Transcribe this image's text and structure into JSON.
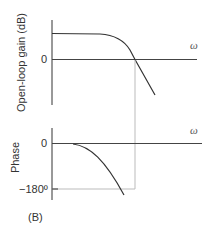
{
  "figure_label": "(B)",
  "gain_plot": {
    "ylabel": "Open-loop gain (dB)",
    "zero_tick": "0",
    "xlabel": "ω"
  },
  "phase_plot": {
    "ylabel": "Phase",
    "zero_tick": "0",
    "minus180_tick": "−180º",
    "xlabel": "ω"
  },
  "colors": {
    "axis": "#333333",
    "curve": "#333333",
    "guide": "#bbbbbb"
  }
}
